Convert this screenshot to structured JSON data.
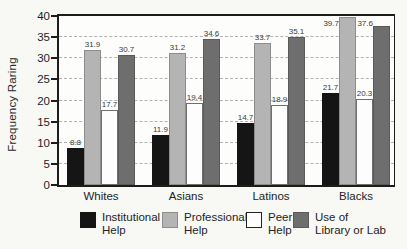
{
  "chart_data": {
    "type": "bar",
    "title": "",
    "xlabel": "",
    "ylabel": "Frequency Raring",
    "categories": [
      "Whites",
      "Asians",
      "Latinos",
      "Blacks"
    ],
    "series": [
      {
        "name": "Institutional Help",
        "legend_lines": [
          "Institutional",
          "Help"
        ],
        "color": "#151515",
        "border": "#151515",
        "values": [
          8.8,
          11.9,
          14.7,
          21.7
        ]
      },
      {
        "name": "Professional Help",
        "legend_lines": [
          "Professional",
          "Help"
        ],
        "color": "#b4b4b4",
        "border": "#8d8d8d",
        "values": [
          31.9,
          31.2,
          33.7,
          39.7
        ]
      },
      {
        "name": "Peer Help",
        "legend_lines": [
          "Peer",
          "Help"
        ],
        "color": "#fdfdfd",
        "border": "#6f6f6f",
        "values": [
          17.7,
          19.4,
          18.9,
          20.3
        ]
      },
      {
        "name": "Use of Library or Lab",
        "legend_lines": [
          "Use of",
          "Library or Lab"
        ],
        "color": "#6e6e6e",
        "border": "#5a5a5a",
        "values": [
          30.7,
          34.6,
          35.1,
          37.6
        ]
      }
    ],
    "ylim": [
      0,
      40
    ],
    "yticks": [
      0,
      5,
      10,
      15,
      20,
      25,
      30,
      35,
      40
    ],
    "grid": "horizontal-dashed",
    "legend_position": "bottom",
    "value_labels": true,
    "colors": {
      "frame": "#1c1c1c",
      "gridline": "#b2b2b2",
      "background": "#f8f8f5"
    }
  }
}
